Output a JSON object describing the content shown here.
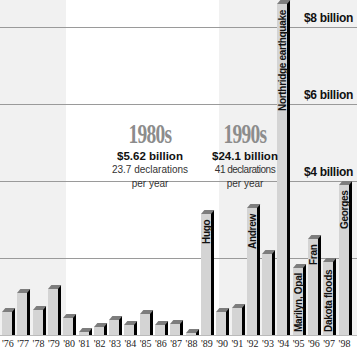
{
  "chart_data": {
    "type": "bar",
    "title": "",
    "xlabel": "",
    "ylabel": "",
    "categories": [
      "'76",
      "'77",
      "'78",
      "'79",
      "'80",
      "'81",
      "'82",
      "'83",
      "'84",
      "'85",
      "'86",
      "'87",
      "'88",
      "'89",
      "'90",
      "'91",
      "'92",
      "'93",
      "'94",
      "'95",
      "'96",
      "'97",
      "'98"
    ],
    "values": [
      0.6,
      1.1,
      0.65,
      1.2,
      0.45,
      0.08,
      0.2,
      0.4,
      0.25,
      0.55,
      0.25,
      0.28,
      0.05,
      3.15,
      0.6,
      0.7,
      3.3,
      2.1,
      8.6,
      1.75,
      2.5,
      1.9,
      3.9
    ],
    "units": "billions of dollars",
    "ylim": [
      0,
      8.7
    ],
    "grid": true,
    "y_ticks": [
      {
        "value": 8,
        "label": "$8 billion"
      },
      {
        "value": 6,
        "label": "$6 billion"
      },
      {
        "value": 4,
        "label": "$4 billion"
      },
      {
        "value": 2,
        "label": ""
      }
    ],
    "bar_annotations": [
      {
        "category": "'89",
        "label": "Hugo"
      },
      {
        "category": "'92",
        "label": "Andrew"
      },
      {
        "category": "'94",
        "label": "Northridge earthquake"
      },
      {
        "category": "'95",
        "label": "Marilyn, Opal"
      },
      {
        "category": "'96",
        "label": "Fran"
      },
      {
        "category": "'97",
        "label": "Dakota floods"
      },
      {
        "category": "'98",
        "label": "Georges"
      }
    ],
    "decade_summaries": [
      {
        "decade": "1980s",
        "total": "$5.62 billion",
        "declarations": "23.7 declarations",
        "per": "per year"
      },
      {
        "decade": "1990s",
        "total": "$24.1 billion",
        "declarations": "41 declarations",
        "per": "per year"
      }
    ],
    "colors": {
      "bar_front": "#d4d4d4",
      "bar_side": "#000000",
      "bar_top": "#7d7d7d",
      "decade_shade": "#f1f1f1",
      "grid": "#9a9a9a"
    }
  }
}
